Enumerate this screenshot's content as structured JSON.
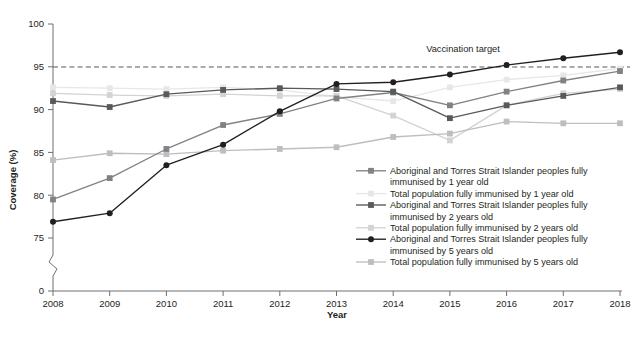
{
  "figure": {
    "title_partial": "",
    "background": "#ffffff"
  },
  "axes": {
    "y_title": "Coverage (%)",
    "x_title": "Year",
    "y_ticks": [
      "100",
      "95",
      "90",
      "85",
      "80",
      "75"
    ],
    "y_zero_tick": "0",
    "x_ticks": [
      "2008",
      "2009",
      "2010",
      "2011",
      "2012",
      "2013",
      "2014",
      "2015",
      "2016",
      "2017",
      "2018"
    ],
    "axis_break": true
  },
  "annotations": [
    {
      "name": "vaccination-target-label",
      "text": "Vaccination target",
      "value": 95
    }
  ],
  "colors": {
    "axis": "#6d6e70",
    "target_line": "#58595b",
    "ind_1yr": "#808285",
    "tot_1yr": "#e6e7e8",
    "ind_2yr": "#58595b",
    "tot_2yr": "#d1d3d4",
    "ind_5yr": "#231f20",
    "tot_5yr": "#bcbec0"
  },
  "chart_data": {
    "type": "line",
    "title": "",
    "xlabel": "Year",
    "ylabel": "Coverage (%)",
    "x": [
      2008,
      2009,
      2010,
      2011,
      2012,
      2013,
      2014,
      2015,
      2016,
      2017,
      2018
    ],
    "ylim": [
      74.0,
      100.0
    ],
    "y_ticks": [
      75,
      80,
      85,
      90,
      95,
      100
    ],
    "grid": false,
    "legend_position": "inside-bottom-right",
    "target_value": 95,
    "series": [
      {
        "name": "Aboriginal and Torres Strait Islander peoples fully immunised by 1 year old",
        "key": "ind_1yr",
        "marker": "square",
        "color": "#808285",
        "values": [
          79.5,
          82.0,
          85.4,
          88.2,
          89.5,
          91.3,
          92.0,
          90.5,
          92.1,
          93.4,
          94.5
        ]
      },
      {
        "name": "Total population fully immunised by 1 year old",
        "key": "tot_1yr",
        "marker": "square",
        "color": "#e6e7e8",
        "values": [
          92.6,
          92.5,
          92.4,
          92.6,
          92.3,
          91.5,
          91.0,
          92.6,
          93.5,
          94.0,
          94.8
        ]
      },
      {
        "name": "Aboriginal and Torres Strait Islander peoples fully immunised by 2 years old",
        "key": "ind_2yr",
        "marker": "square",
        "color": "#58595b",
        "values": [
          91.0,
          90.3,
          91.8,
          92.3,
          92.5,
          92.4,
          92.1,
          89.0,
          90.5,
          91.6,
          92.6
        ]
      },
      {
        "name": "Total population fully immunised by 2 years old",
        "key": "tot_2yr",
        "marker": "square",
        "color": "#d1d3d4",
        "values": [
          91.9,
          91.7,
          91.6,
          91.8,
          91.6,
          91.6,
          89.3,
          86.4,
          90.5,
          91.9,
          92.4
        ]
      },
      {
        "name": "Aboriginal and Torres Strait Islander peoples fully immunised by 5 years old",
        "key": "ind_5yr",
        "marker": "circle",
        "color": "#231f20",
        "values": [
          76.9,
          77.9,
          83.5,
          85.9,
          89.8,
          93.0,
          93.2,
          94.1,
          95.2,
          96.0,
          96.7
        ]
      },
      {
        "name": "Total population fully immunised by 5 years old",
        "key": "tot_5yr",
        "marker": "square",
        "color": "#bcbec0",
        "values": [
          84.1,
          84.9,
          84.8,
          85.2,
          85.4,
          85.6,
          86.8,
          87.2,
          88.6,
          88.4,
          88.4
        ]
      }
    ]
  },
  "legend": {
    "items": [
      {
        "label_line1": "Aboriginal and Torres Strait Islander peoples fully",
        "label_line2": "immunised by 1 year old",
        "key": "ind_1yr"
      },
      {
        "label_line1": "Total population fully immunised by 1 year old",
        "label_line2": "",
        "key": "tot_1yr"
      },
      {
        "label_line1": "Aboriginal and Torres Strait Islander peoples fully",
        "label_line2": "immunised by 2 years old",
        "key": "ind_2yr"
      },
      {
        "label_line1": "Total population fully immunised by 2 years old",
        "label_line2": "",
        "key": "tot_2yr"
      },
      {
        "label_line1": "Aboriginal and Torres Strait Islander peoples fully",
        "label_line2": "immunised by 5 years old",
        "key": "ind_5yr"
      },
      {
        "label_line1": "Total population fully immunised by 5 years old",
        "label_line2": "",
        "key": "tot_5yr"
      }
    ]
  }
}
